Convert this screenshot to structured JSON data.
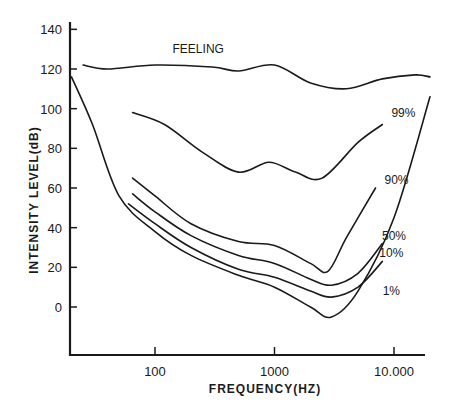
{
  "chart_data": {
    "type": "line",
    "title": "",
    "xlabel": "FREQUENCY(HZ)",
    "ylabel": "INTENSITY LEVEL(dB)",
    "xscale": "log",
    "xlim": [
      20,
      20000
    ],
    "ylim": [
      -24,
      145
    ],
    "grid": false,
    "legend": "inline labels",
    "x_ticks": [
      {
        "value": 100,
        "label": "100"
      },
      {
        "value": 1000,
        "label": "1000"
      },
      {
        "value": 10000,
        "label": "10.000"
      }
    ],
    "y_ticks": [
      {
        "value": 140,
        "label": "140"
      },
      {
        "value": 120,
        "label": "120"
      },
      {
        "value": 100,
        "label": "100"
      },
      {
        "value": 80,
        "label": "80"
      },
      {
        "value": 60,
        "label": "60"
      },
      {
        "value": 40,
        "label": "40"
      },
      {
        "value": 20,
        "label": "20"
      },
      {
        "value": 0,
        "label": "0"
      }
    ],
    "series": [
      {
        "name": "FEELING",
        "x": [
          25,
          40,
          100,
          300,
          500,
          1000,
          2000,
          4000,
          8000,
          15000,
          20000
        ],
        "y": [
          122,
          120,
          122,
          121,
          119,
          122,
          113,
          110,
          115,
          117,
          116
        ]
      },
      {
        "name": "99%",
        "x": [
          65,
          120,
          250,
          500,
          900,
          1500,
          2500,
          5000,
          8000
        ],
        "y": [
          98,
          92,
          78,
          68,
          73,
          68,
          65,
          83,
          92
        ]
      },
      {
        "name": "90%",
        "x": [
          65,
          100,
          200,
          500,
          1000,
          2000,
          2800,
          4000,
          7000
        ],
        "y": [
          65,
          56,
          42,
          33,
          31,
          22,
          18,
          35,
          60
        ]
      },
      {
        "name": "50%",
        "x": [
          65,
          100,
          200,
          500,
          1000,
          2000,
          3000,
          5000,
          8000
        ],
        "y": [
          57,
          48,
          36,
          26,
          22,
          14,
          11,
          17,
          32
        ]
      },
      {
        "name": "10%",
        "x": [
          60,
          100,
          200,
          500,
          1000,
          2000,
          3000,
          5000,
          8000
        ],
        "y": [
          52,
          42,
          30,
          19,
          15,
          8,
          5,
          10,
          23
        ]
      },
      {
        "name": "1%",
        "x": [
          20,
          30,
          50,
          100,
          200,
          500,
          1000,
          2000,
          3000,
          5000,
          10000,
          20000
        ],
        "y": [
          116,
          92,
          56,
          38,
          26,
          16,
          10,
          0,
          -5,
          8,
          45,
          106
        ]
      }
    ],
    "annotations": [
      {
        "text": "FEELING",
        "x": 230,
        "y": 128
      },
      {
        "text": "99%",
        "x": 12000,
        "y": 96
      },
      {
        "text": "90%",
        "x": 10500,
        "y": 62
      },
      {
        "text": "50%",
        "x": 10000,
        "y": 34
      },
      {
        "text": "10%",
        "x": 9500,
        "y": 25
      },
      {
        "text": "1%",
        "x": 9500,
        "y": 6
      }
    ]
  }
}
